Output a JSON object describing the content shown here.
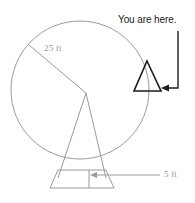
{
  "figure": {
    "background_color": "#ffffff",
    "line_color_light": "#9a9a9a",
    "line_color_dark": "#1b1b1b",
    "labels": {
      "radius": "25 ft",
      "base_width": "5 ft",
      "callout": "You are here."
    },
    "measurements": [
      {
        "name": "radius",
        "value": 25,
        "unit": "ft",
        "label": "25 ft"
      },
      {
        "name": "base_width",
        "value": 5,
        "unit": "ft",
        "label": "5 ft"
      }
    ],
    "geometry": {
      "wheel": {
        "cx": 80,
        "cy": 90,
        "r": 69
      },
      "hub": {
        "x": 86,
        "y": 93
      },
      "radius_spoke_end": {
        "x": 29,
        "y": 45
      },
      "support_left_foot": {
        "x": 58,
        "y": 178
      },
      "support_right_foot": {
        "x": 106,
        "y": 178
      },
      "base_top_left": {
        "x": 58,
        "y": 170
      },
      "base_top_right": {
        "x": 106,
        "y": 170
      },
      "base_bottom_left": {
        "x": 50,
        "y": 188
      },
      "base_bottom_right": {
        "x": 114,
        "y": 188
      },
      "base_divider_x": 89,
      "car": {
        "apex_x": 147,
        "apex_y": 61,
        "left_x": 134,
        "right_x": 161,
        "base_y": 91
      },
      "leader": {
        "x": 178,
        "top_y": 31,
        "bottom_y": 88,
        "arrow_tip_x": 162
      }
    }
  }
}
